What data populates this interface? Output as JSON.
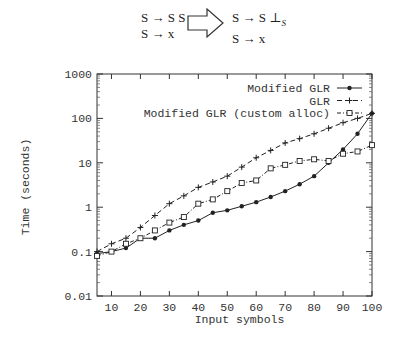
{
  "grammar": {
    "before": [
      "S → S S",
      "S → x"
    ],
    "after_line1_main": "S → S ⊥",
    "after_line1_sub": "S",
    "after_line2": "S → x",
    "arrow_icon": "right-hollow-arrow-icon"
  },
  "chart_data": {
    "type": "line",
    "title": "",
    "xlabel": "Input symbols",
    "ylabel": "Time (seconds)",
    "yscale": "log",
    "xlim": [
      5,
      100
    ],
    "ylim": [
      0.01,
      1000
    ],
    "xticks": [
      10,
      20,
      30,
      40,
      50,
      60,
      70,
      80,
      90,
      100
    ],
    "yticks": [
      "0.01",
      "0.1",
      "1",
      "10",
      "100",
      "1000"
    ],
    "grid": false,
    "legend_position": "upper right",
    "x": [
      5,
      10,
      15,
      20,
      25,
      30,
      35,
      40,
      45,
      50,
      55,
      60,
      65,
      70,
      75,
      80,
      85,
      90,
      95,
      100
    ],
    "series": [
      {
        "name": "Modified GLR",
        "style": "solid",
        "marker": "diamond",
        "values": [
          0.09,
          0.1,
          0.12,
          0.2,
          0.2,
          0.3,
          0.4,
          0.5,
          0.75,
          0.85,
          1.05,
          1.3,
          1.7,
          2.3,
          3.3,
          5,
          10,
          20,
          45,
          130
        ]
      },
      {
        "name": "GLR",
        "style": "dashed",
        "marker": "plus",
        "values": [
          0.1,
          0.15,
          0.2,
          0.35,
          0.65,
          1.2,
          1.8,
          2.8,
          3.7,
          5,
          8,
          13,
          19,
          28,
          35,
          45,
          60,
          80,
          100,
          130
        ]
      },
      {
        "name": "Modified GLR (custom alloc)",
        "style": "dotdash",
        "marker": "square",
        "values": [
          0.08,
          0.1,
          0.15,
          0.2,
          0.3,
          0.45,
          0.6,
          1.2,
          1.5,
          2.3,
          3.5,
          4.0,
          7.5,
          9,
          11,
          12,
          11,
          16,
          18,
          25
        ]
      }
    ]
  }
}
